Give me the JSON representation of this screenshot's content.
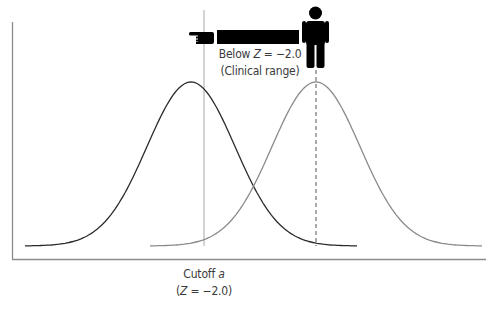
{
  "diagram": {
    "title": "",
    "annotation": {
      "line1_prefix": "Below ",
      "line1_var": "Z",
      "line1_suffix": " = −2.0",
      "line2": "(Clinical range)"
    },
    "cutoff_label": {
      "line1_prefix": "Cutoff ",
      "line1_var": "a",
      "line2_open": "(",
      "line2_var": "Z",
      "line2_suffix": " = −2.0)"
    },
    "icons": [
      "pointing-hand-icon",
      "person-icon"
    ],
    "colors": {
      "clinical_curve": "#2a2a2a",
      "normal_curve": "#8a8a8a",
      "axis": "#8c8c8c",
      "cutoff_line": "#a8a8a8",
      "icons": "#000000"
    }
  },
  "chart_data": {
    "type": "line",
    "title": "",
    "xlabel": "",
    "ylabel": "",
    "grid": false,
    "series": [
      {
        "name": "Clinical distribution (left)",
        "mean_x_px": 191,
        "peak_y_px": 82,
        "color": "#2a2a2a"
      },
      {
        "name": "Normal distribution (right)",
        "mean_x_px": 316,
        "peak_y_px": 82,
        "color": "#8a8a8a"
      }
    ],
    "cutoff": {
      "label": "Cutoff a",
      "z": -2.0
    },
    "annotation": "Below Z = −2.0 (Clinical range)"
  }
}
